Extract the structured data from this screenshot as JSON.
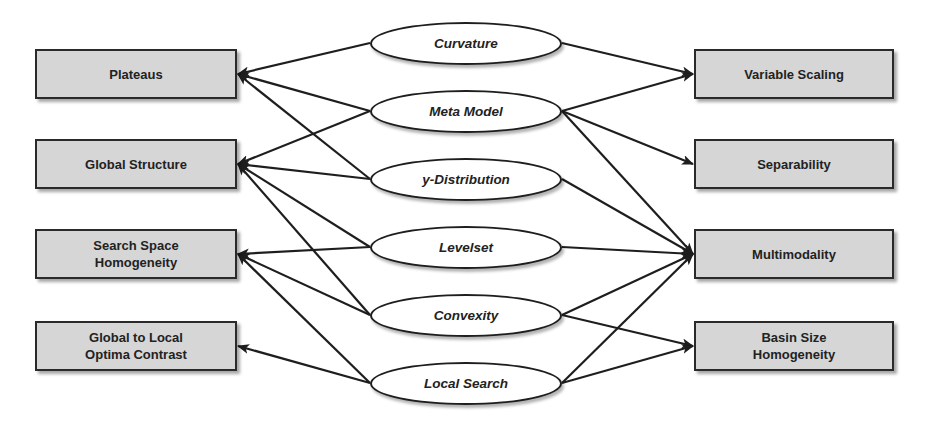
{
  "diagram": {
    "left_nodes": [
      {
        "id": "plateaus",
        "label": "Plateaus"
      },
      {
        "id": "global_structure",
        "label": "Global Structure"
      },
      {
        "id": "search_space_homogeneity",
        "label": "Search Space\nHomogeneity"
      },
      {
        "id": "global_local_contrast",
        "label": "Global to Local\nOptima Contrast"
      }
    ],
    "center_nodes": [
      {
        "id": "curvature",
        "label": "Curvature"
      },
      {
        "id": "meta_model",
        "label": "Meta Model"
      },
      {
        "id": "y_distribution",
        "label": "y-Distribution"
      },
      {
        "id": "levelset",
        "label": "Levelset"
      },
      {
        "id": "convexity",
        "label": "Convexity"
      },
      {
        "id": "local_search",
        "label": "Local Search"
      }
    ],
    "right_nodes": [
      {
        "id": "variable_scaling",
        "label": "Variable Scaling"
      },
      {
        "id": "separability",
        "label": "Separability"
      },
      {
        "id": "multimodality",
        "label": "Multimodality"
      },
      {
        "id": "basin_size_homogeneity",
        "label": "Basin Size\nHomogeneity"
      }
    ],
    "edges": [
      {
        "from": "curvature",
        "to": "plateaus"
      },
      {
        "from": "meta_model",
        "to": "plateaus"
      },
      {
        "from": "y_distribution",
        "to": "plateaus"
      },
      {
        "from": "meta_model",
        "to": "global_structure"
      },
      {
        "from": "y_distribution",
        "to": "global_structure"
      },
      {
        "from": "levelset",
        "to": "global_structure"
      },
      {
        "from": "convexity",
        "to": "global_structure"
      },
      {
        "from": "levelset",
        "to": "search_space_homogeneity"
      },
      {
        "from": "convexity",
        "to": "search_space_homogeneity"
      },
      {
        "from": "local_search",
        "to": "search_space_homogeneity"
      },
      {
        "from": "local_search",
        "to": "global_local_contrast"
      },
      {
        "from": "curvature",
        "to": "variable_scaling"
      },
      {
        "from": "meta_model",
        "to": "variable_scaling"
      },
      {
        "from": "meta_model",
        "to": "separability"
      },
      {
        "from": "meta_model",
        "to": "multimodality"
      },
      {
        "from": "y_distribution",
        "to": "multimodality"
      },
      {
        "from": "levelset",
        "to": "multimodality"
      },
      {
        "from": "convexity",
        "to": "multimodality"
      },
      {
        "from": "local_search",
        "to": "multimodality"
      },
      {
        "from": "convexity",
        "to": "basin_size_homogeneity"
      },
      {
        "from": "local_search",
        "to": "basin_size_homogeneity"
      }
    ],
    "colors": {
      "box_fill": "#d6d6d6",
      "stroke": "#1e1e1e",
      "ellipse_fill": "#ffffff"
    }
  }
}
